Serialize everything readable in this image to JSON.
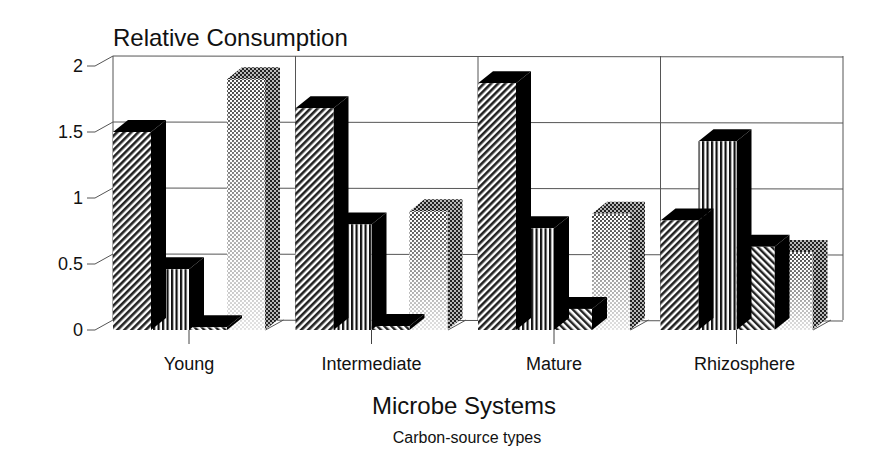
{
  "chart_data": {
    "type": "bar",
    "style": "3d-grouped-bar",
    "title": "Relative Consumption",
    "xlabel": "Microbe Systems",
    "legend_title": "Carbon-source types",
    "ylabel": "",
    "ylim": [
      0,
      2
    ],
    "yticks": [
      "0",
      "0.5",
      "1",
      "1.5",
      "2"
    ],
    "ytick_values": [
      0,
      0.5,
      1,
      1.5,
      2
    ],
    "grid": true,
    "categories": [
      "Young",
      "Intermediate",
      "Mature",
      "Rhizosphere"
    ],
    "series": [
      {
        "name": "Series 1 (diagonal hatch)",
        "pattern": "diag-right",
        "values": [
          1.5,
          1.68,
          1.87,
          0.83
        ]
      },
      {
        "name": "Series 2 (vertical lines)",
        "pattern": "vertical",
        "values": [
          0.46,
          0.8,
          0.77,
          1.43
        ]
      },
      {
        "name": "Series 3 (diagonal hatch)",
        "pattern": "diag-left",
        "values": [
          0.02,
          0.03,
          0.16,
          0.63
        ]
      },
      {
        "name": "Series 4 (dot gradient)",
        "pattern": "dots",
        "values": [
          1.9,
          0.9,
          0.88,
          0.59
        ]
      }
    ]
  },
  "colors": {
    "ink": "#111111",
    "grid": "#555555",
    "background": "#ffffff",
    "side": "#000000"
  }
}
